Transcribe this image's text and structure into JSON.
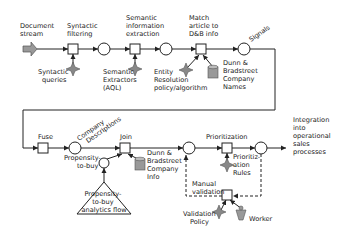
{
  "diagram": {
    "type": "workflow / data-flow diagram",
    "nodes": {
      "document_stream": "Document stream",
      "syntactic_filtering": "Syntactic filtering",
      "syntactic_queries": "Syntactic queries",
      "semantic_extraction": "Semantic information extraction",
      "semantic_extractors": "Semantic Extractors (AQL)",
      "match_article": "Match article to D&B info",
      "entity_resolution": "Entity Resolution policy/algorithm",
      "dnb_company_names": "Dunn & Bradstreet Company Names",
      "signals": "Signals",
      "fuse": "Fuse",
      "company_descriptions": "Company Descriptions",
      "join": "Join",
      "propensity_to_buy": "Propensity-to-buy",
      "propensity_flow": "Propensity-to-buy analytics flow",
      "dnb_company_info": "Dunn & Bradstreet Company Info",
      "prioritization": "Prioritization",
      "prioritization_rules": "Prioritization Rules",
      "manual_validation": "Manual validation",
      "validation_policy": "Validation Policy",
      "worker": "Worker",
      "integration": "Integration into operational sales processes"
    },
    "lines": {
      "document_stream": [
        "Document",
        "stream"
      ],
      "syntactic_filtering": [
        "Syntactic",
        "filtering"
      ],
      "syntactic_queries": [
        "Syntactic",
        "queries"
      ],
      "semantic_extraction": [
        "Semantic",
        "information",
        "extraction"
      ],
      "semantic_extractors": [
        "Semantic",
        "Extractors",
        "(AQL)"
      ],
      "match_article": [
        "Match",
        "article to",
        "D&B info"
      ],
      "entity_resolution": [
        "Entity",
        "Resolution",
        "policy/algorithm"
      ],
      "dnb_company_names": [
        "Dunn &",
        "Bradstreet",
        "Company",
        "Names"
      ],
      "signals": [
        "Signals"
      ],
      "fuse": [
        "Fuse"
      ],
      "company_descriptions": [
        "Company",
        "Descriptions"
      ],
      "join": [
        "Join"
      ],
      "propensity_to_buy": [
        "Propensity-",
        "to-buy"
      ],
      "propensity_flow": [
        "Propensity-",
        "to-buy",
        "analytics flow"
      ],
      "dnb_company_info": [
        "Dunn &",
        "Bradstreet",
        "Company",
        "Info"
      ],
      "prioritization": [
        "Prioritization"
      ],
      "prioritization_rules": [
        "Prioritiz-",
        "ation",
        "Rules"
      ],
      "manual_validation": [
        "Manual",
        "validation"
      ],
      "validation_policy": [
        "Validation",
        "Policy"
      ],
      "worker": [
        "Worker"
      ],
      "integration": [
        "Integration",
        "into",
        "operational",
        "sales",
        "processes"
      ]
    },
    "icons": {
      "start": "thick-arrow-icon",
      "task": "square-task-icon",
      "state": "circle-state-icon",
      "policy": "diamond-star-icon",
      "database": "database-cylinder-icon",
      "subflow": "triangle-subflow-icon",
      "worker": "worker-person-icon"
    },
    "colors": {
      "stroke": "#222222",
      "icon_fill": "#888888",
      "start_arrow_fill": "#999999",
      "background": "#ffffff"
    }
  }
}
